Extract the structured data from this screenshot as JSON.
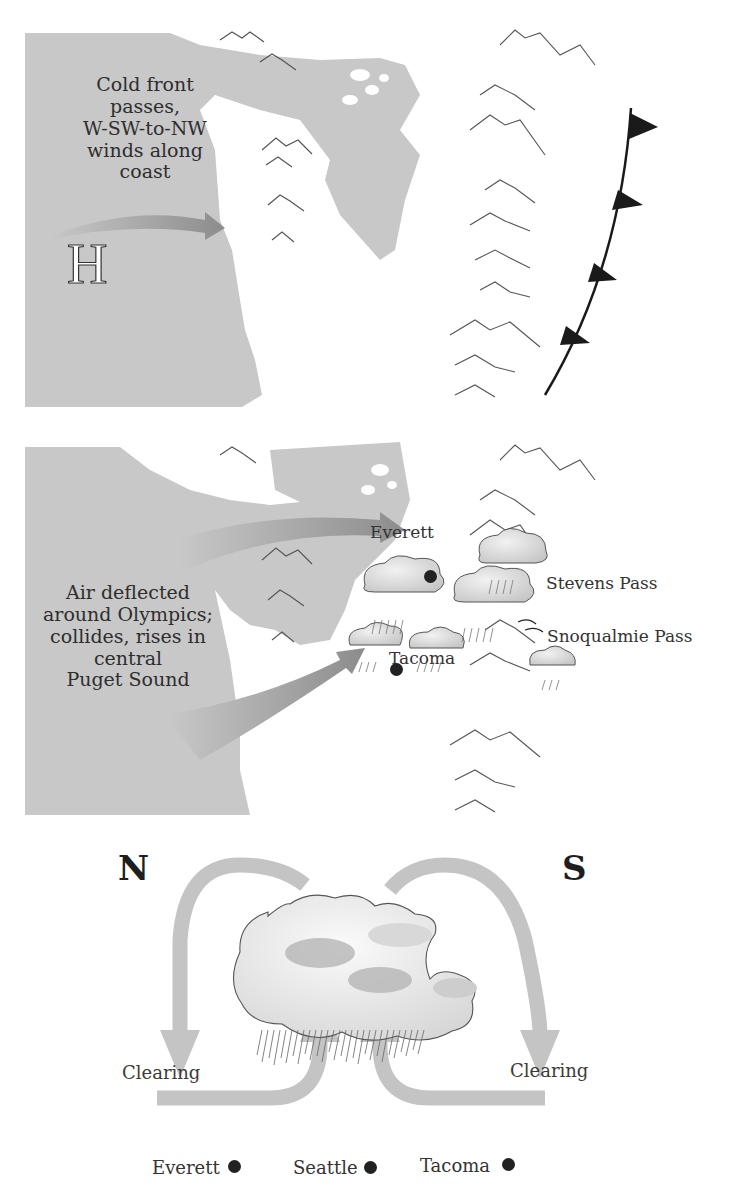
{
  "panel1": {
    "caption_lines": [
      "Cold front",
      "passes,",
      "W-SW-to-NW",
      "winds along",
      "coast"
    ],
    "caption": "Cold front passes, W-SW-to-NW winds along coast",
    "pressure_symbol": "H",
    "icons": [
      "ocean-region",
      "wind-arrow-icon",
      "high-pressure-icon",
      "mountain-range-icon",
      "cold-front-icon"
    ]
  },
  "panel2": {
    "caption_lines": [
      "Air deflected",
      "around Olympics;",
      "collides, rises in",
      "central",
      "Puget Sound"
    ],
    "caption": "Air deflected around Olympics; collides, rises in central Puget Sound",
    "cities": [
      {
        "name": "Everett"
      },
      {
        "name": "Tacoma"
      }
    ],
    "passes": [
      {
        "name": "Stevens Pass"
      },
      {
        "name": "Snoqualmie Pass"
      }
    ],
    "icons": [
      "wind-arrow-icon",
      "rain-cloud-icon",
      "mountain-range-icon",
      "city-dot-icon"
    ]
  },
  "panel3": {
    "north_label": "N",
    "south_label": "S",
    "clearing_left": "Clearing",
    "clearing_right": "Clearing",
    "cities": [
      {
        "name": "Everett"
      },
      {
        "name": "Seattle"
      },
      {
        "name": "Tacoma"
      }
    ],
    "icons": [
      "convergence-arrow-icon",
      "storm-cloud-icon",
      "rain-icon"
    ]
  },
  "colors": {
    "ocean": "#c8c8c8",
    "land": "#ffffff",
    "arrow_light": "#bdbdbd",
    "arrow_dark": "#8a8a8a",
    "front": "#1a1a1a",
    "mountain_line": "#555555",
    "flow_arrow": "#c4c4c4"
  }
}
